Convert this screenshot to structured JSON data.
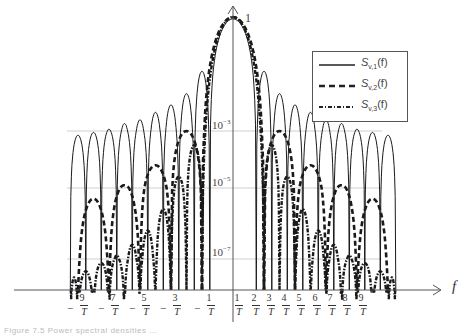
{
  "chart_data": {
    "type": "line",
    "title": "",
    "xlabel": "f",
    "ylabel": "",
    "yscale": "log",
    "y_ticks": [
      "1",
      "10^-3",
      "10^-5",
      "10^-7"
    ],
    "x_ticks": [
      {
        "num": "9",
        "den": "T",
        "sign": "-"
      },
      {
        "num": "7",
        "den": "T",
        "sign": "-"
      },
      {
        "num": "5",
        "den": "T",
        "sign": "-"
      },
      {
        "num": "3",
        "den": "T",
        "sign": "-"
      },
      {
        "num": "1",
        "den": "T",
        "sign": "-"
      },
      {
        "num": "1",
        "den": "T",
        "sign": ""
      },
      {
        "num": "2",
        "den": "T",
        "sign": ""
      },
      {
        "num": "3",
        "den": "T",
        "sign": ""
      },
      {
        "num": "4",
        "den": "T",
        "sign": ""
      },
      {
        "num": "5",
        "den": "T",
        "sign": ""
      },
      {
        "num": "6",
        "den": "T",
        "sign": ""
      },
      {
        "num": "7",
        "den": "T",
        "sign": ""
      },
      {
        "num": "8",
        "den": "T",
        "sign": ""
      },
      {
        "num": "9",
        "den": "T",
        "sign": ""
      }
    ],
    "x_range_fT": [
      -10.5,
      10.5
    ],
    "grid": "horizontal at 10^-3, 10^-5, 10^-7",
    "legend_position": "upper right",
    "series": [
      {
        "name": "S_{v,1}(f)",
        "label_main": "S",
        "label_sub": "v,1",
        "label_tail": "(f)",
        "style": "solid-thin",
        "description": "sinc^2-type spectrum, zeros at half-integer offsets, sidelobes ~10^-2.5 to 10^-3.5",
        "sidelobe_peaks_log10": [
          -1.4,
          -2.0,
          -2.3,
          -2.5,
          -2.7,
          -2.8,
          -2.95,
          -3.05,
          -3.15,
          -3.25
        ]
      },
      {
        "name": "S_{v,2}(f)",
        "label_main": "S",
        "label_sub": "v,2",
        "label_tail": "(f)",
        "style": "dashed",
        "description": "zeros at even multiples of 1/T, sidelobes peak near odd multiples",
        "sidelobe_peaks_log10": [
          -3.0,
          -4.2,
          -4.9,
          -5.3
        ]
      },
      {
        "name": "S_{v,3}(f)",
        "label_main": "S",
        "label_sub": "v,3",
        "label_tail": "(f)",
        "style": "dash-dot",
        "description": "zeros at integer multiples of 1/T, fastest decay",
        "sidelobe_peaks_log10": [
          -3.5,
          -4.6,
          -5.6,
          -6.2,
          -6.6,
          -6.9,
          -7.2,
          -7.6,
          -7.9
        ]
      }
    ]
  },
  "axis": {
    "f_label": "f",
    "one_label": "1",
    "y3": "10",
    "y3exp": "−3",
    "y5": "10",
    "y5exp": "−5",
    "y7": "10",
    "y7exp": "−7"
  },
  "caption": "Figure 7.5  Power spectral densities ..."
}
